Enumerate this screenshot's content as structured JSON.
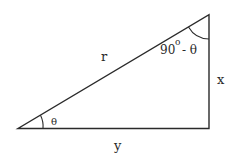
{
  "diagram": {
    "type": "right-triangle",
    "labels": {
      "hypotenuse": "r",
      "vertical_side": "x",
      "horizontal_side": "y",
      "bottom_left_angle": "θ",
      "top_angle_number": "90",
      "top_angle_degree": "o",
      "top_angle_rest": "- θ"
    },
    "colors": {
      "line": "#2a2a2a",
      "background": "#ffffff"
    }
  }
}
